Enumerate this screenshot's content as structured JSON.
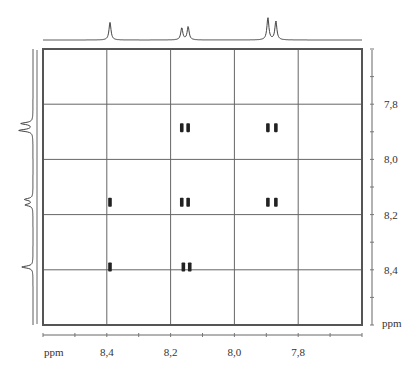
{
  "chart_data": {
    "type": "heatmap",
    "subtype": "2D NMR COSY contour plot",
    "title": "",
    "xlabel": "ppm",
    "ylabel": "ppm",
    "xlim": [
      8.6,
      7.6
    ],
    "ylim": [
      7.6,
      8.6
    ],
    "x_ticks": [
      8.4,
      8.2,
      8.0,
      7.8
    ],
    "x_tick_labels": [
      "8,4",
      "8,2",
      "8,0",
      "7,8"
    ],
    "y_ticks": [
      7.8,
      8.0,
      8.2,
      8.4
    ],
    "y_tick_labels": [
      "7,8",
      "8,0",
      "8,2",
      "8,4"
    ],
    "grid": true,
    "projection_1d_peaks": [
      {
        "shift": 8.39,
        "height": 0.8,
        "multiplicity": "singlet"
      },
      {
        "shift": 8.165,
        "height": 0.55,
        "multiplicity": "doublet"
      },
      {
        "shift": 8.145,
        "height": 0.6,
        "multiplicity": "doublet"
      },
      {
        "shift": 7.895,
        "height": 1.0,
        "multiplicity": "doublet"
      },
      {
        "shift": 7.87,
        "height": 0.85,
        "multiplicity": "doublet"
      }
    ],
    "peaks_2d": [
      {
        "x": 8.39,
        "y": 8.39,
        "type": "diagonal"
      },
      {
        "x": 8.16,
        "y": 8.39,
        "type": "cross"
      },
      {
        "x": 8.14,
        "y": 8.39,
        "type": "cross"
      },
      {
        "x": 8.39,
        "y": 8.155,
        "type": "cross"
      },
      {
        "x": 8.165,
        "y": 8.155,
        "type": "diagonal"
      },
      {
        "x": 8.145,
        "y": 8.155,
        "type": "diagonal"
      },
      {
        "x": 7.895,
        "y": 8.155,
        "type": "cross"
      },
      {
        "x": 7.87,
        "y": 8.155,
        "type": "cross"
      },
      {
        "x": 8.165,
        "y": 7.885,
        "type": "cross"
      },
      {
        "x": 8.145,
        "y": 7.885,
        "type": "cross"
      },
      {
        "x": 7.895,
        "y": 7.885,
        "type": "diagonal"
      },
      {
        "x": 7.87,
        "y": 7.885,
        "type": "diagonal"
      }
    ]
  }
}
